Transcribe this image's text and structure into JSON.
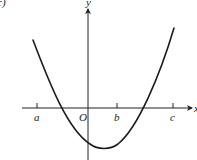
{
  "figure": {
    "panel_label": "c)",
    "axes": {
      "x_label": "x",
      "y_label": "y",
      "origin_label": "O"
    },
    "ticks": [
      {
        "label": "a",
        "x": 37
      },
      {
        "label": "b",
        "x": 117
      },
      {
        "label": "c",
        "x": 173
      }
    ],
    "curve": {
      "type": "parabola",
      "opens": "up",
      "roots_between": [
        "a and O",
        "b and c"
      ],
      "vertex_between": "O and b",
      "color": "#1a1a1a"
    }
  }
}
